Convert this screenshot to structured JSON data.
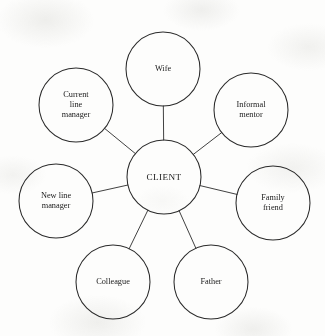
{
  "diagram": {
    "type": "hub-and-spoke network map",
    "background_color": "#fdfdfc",
    "stroke_color": "#2b2b2b",
    "text_color": "#1a1a1a",
    "hub": {
      "id": "client",
      "label": "CLIENT",
      "cx": 164,
      "cy": 177,
      "r": 37
    },
    "satellites": [
      {
        "id": "wife",
        "label": "Wife",
        "cx": 163,
        "cy": 69,
        "r": 37
      },
      {
        "id": "informal-mentor",
        "label": "Informal\nmentor",
        "cx": 251,
        "cy": 110,
        "r": 37
      },
      {
        "id": "family-friend",
        "label": "Family\nfriend",
        "cx": 273,
        "cy": 203,
        "r": 37
      },
      {
        "id": "father",
        "label": "Father",
        "cx": 211,
        "cy": 282,
        "r": 37
      },
      {
        "id": "colleague",
        "label": "Colleague",
        "cx": 113,
        "cy": 282,
        "r": 37
      },
      {
        "id": "new-line-manager",
        "label": "New line\nmanager",
        "cx": 56,
        "cy": 201,
        "r": 37
      },
      {
        "id": "current-line-manager",
        "label": "Current\nline\nmanager",
        "cx": 76,
        "cy": 105,
        "r": 37
      }
    ],
    "connections": [
      {
        "from": "client",
        "to": "wife"
      },
      {
        "from": "client",
        "to": "informal-mentor"
      },
      {
        "from": "client",
        "to": "family-friend"
      },
      {
        "from": "client",
        "to": "father"
      },
      {
        "from": "client",
        "to": "colleague"
      },
      {
        "from": "client",
        "to": "new-line-manager"
      },
      {
        "from": "client",
        "to": "current-line-manager"
      }
    ]
  }
}
